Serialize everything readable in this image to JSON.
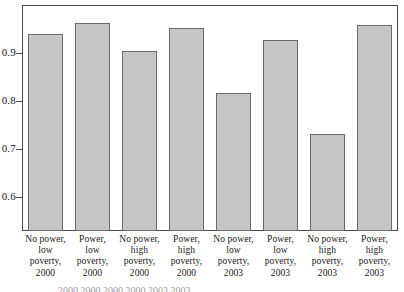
{
  "chart_data": {
    "type": "bar",
    "title": "",
    "xlabel": "",
    "ylabel": "",
    "ylim": [
      0.53,
      1.0
    ],
    "grid": false,
    "legend": "none",
    "yticks": [
      "0.6",
      "0.7",
      "0.8",
      "0.9"
    ],
    "ytick_values": [
      0.6,
      0.7,
      0.8,
      0.9
    ],
    "categories": [
      "No power, low poverty, 2000",
      "Power, low poverty, 2000",
      "No power, high poverty, 2000",
      "Power, high poverty, 2000",
      "No power, low poverty, 2003",
      "Power, low poverty, 2003",
      "No power, high poverty, 2003",
      "Power, high poverty, 2003"
    ],
    "category_lines": [
      [
        "No power,",
        "low",
        "poverty,",
        "2000"
      ],
      [
        "Power,",
        "low",
        "poverty,",
        "2000"
      ],
      [
        "No power,",
        "high",
        "poverty,",
        "2000"
      ],
      [
        "Power,",
        "high",
        "poverty,",
        "2000"
      ],
      [
        "No power,",
        "low",
        "poverty,",
        "2003"
      ],
      [
        "Power,",
        "low",
        "poverty,",
        "2003"
      ],
      [
        "No power,",
        "high",
        "poverty,",
        "2003"
      ],
      [
        "Power,",
        "high",
        "poverty,",
        "2003"
      ]
    ],
    "values": [
      0.94,
      0.963,
      0.905,
      0.952,
      0.818,
      0.928,
      0.731,
      0.958
    ],
    "bar_color": "#c6c6c6",
    "bar_edge_color": "#6b6b6b",
    "axis_color": "#4a4a4a"
  },
  "caption_sliver": "2000       2000       2000       2000       2003       2003"
}
